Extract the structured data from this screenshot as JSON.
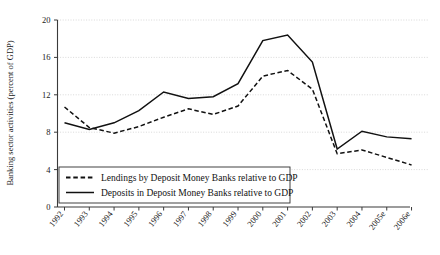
{
  "chart_data": {
    "type": "line",
    "title": "",
    "xlabel": "",
    "ylabel": "Banking sector activities (percent of GDP)",
    "categories": [
      "1992",
      "1993",
      "1994",
      "1995",
      "1996",
      "1997",
      "1998",
      "1999",
      "2000",
      "2001",
      "2002",
      "2003",
      "2004",
      "2005e",
      "2006e"
    ],
    "ylim": [
      0,
      20
    ],
    "yticks": [
      0,
      4,
      8,
      12,
      16,
      20
    ],
    "grid": true,
    "legend_position": "bottom-left-inside",
    "series": [
      {
        "name": "Lendings by Deposit Money Banks relative to GDP",
        "style": "dashed",
        "color": "#111111",
        "values": [
          10.7,
          8.5,
          7.9,
          8.6,
          9.6,
          10.5,
          9.9,
          10.8,
          14.0,
          14.6,
          12.6,
          5.7,
          6.1,
          5.3,
          4.5
        ]
      },
      {
        "name": "Deposits in Deposit Money Banks relative to GDP",
        "style": "solid",
        "color": "#111111",
        "values": [
          9.0,
          8.3,
          9.0,
          10.3,
          12.3,
          11.6,
          11.8,
          13.2,
          17.8,
          18.4,
          15.5,
          6.2,
          8.1,
          7.5,
          7.3
        ]
      }
    ]
  },
  "axis": {
    "y_tick_labels": [
      "0",
      "4",
      "8",
      "12",
      "16",
      "20"
    ],
    "y_title": "Banking sector activities (percent of GDP)",
    "x_tick_labels": [
      "1992",
      "1993",
      "1994",
      "1995",
      "1996",
      "1997",
      "1998",
      "1999",
      "2000",
      "2001",
      "2002",
      "2003",
      "2004",
      "2005e",
      "2006e"
    ]
  },
  "legend": {
    "items": [
      {
        "label": "Lendings by Deposit Money Banks relative to GDP",
        "style": "dashed"
      },
      {
        "label": "Deposits in Deposit Money Banks relative to GDP",
        "style": "solid"
      }
    ]
  },
  "colors": {
    "line": "#111111",
    "grid": "#c9c9c9",
    "axis": "#3a3a3a",
    "background": "#ffffff"
  }
}
